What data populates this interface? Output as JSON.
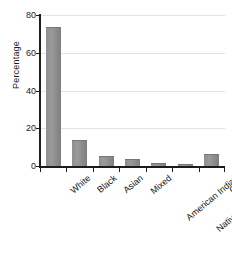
{
  "chart_data": {
    "type": "bar",
    "title": "",
    "xlabel": "",
    "ylabel": "Percentage",
    "ylim": [
      0,
      80
    ],
    "yticks": [
      0,
      20,
      40,
      60,
      80
    ],
    "ytick_labels": [
      "0",
      "20",
      "40",
      "60",
      "80"
    ],
    "grid": true,
    "legend": false,
    "orientation": "vertical",
    "categories": [
      "White",
      "Black",
      "Asian",
      "Mixed",
      "American Indian",
      "Native Hawaiian and Pacific Islander",
      "Other"
    ],
    "category_lines": [
      [
        "White"
      ],
      [
        "Black"
      ],
      [
        "Asian"
      ],
      [
        "Mixed"
      ],
      [
        "American Indian"
      ],
      [
        "Native Hawaiian and",
        "Pacific Islander"
      ],
      [
        "Other"
      ]
    ],
    "values": [
      73,
      13,
      5,
      3,
      1,
      0.2,
      6
    ],
    "bar_color": "#8f8f8f",
    "axis_color": "#1c1c1c",
    "grid_color": "#e2e2e2",
    "background_color": "#ffffff"
  }
}
